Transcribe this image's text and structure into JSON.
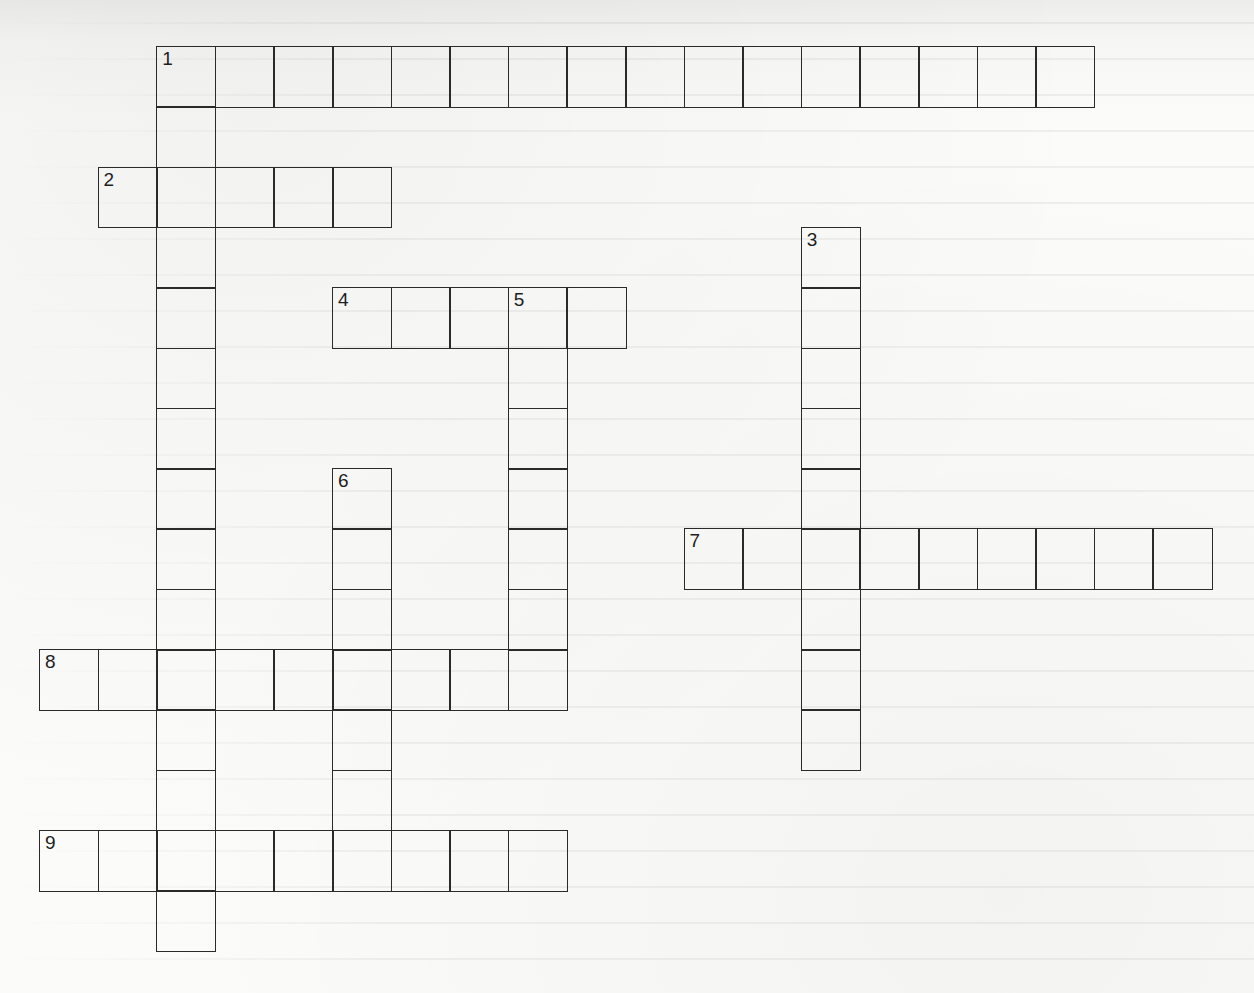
{
  "puzzle": {
    "type": "crossword",
    "grid_origin": {
      "x": 39,
      "y": 46
    },
    "cell_size": {
      "w": 58.6,
      "h": 60.3
    },
    "line_color": "#2a2a2a",
    "paper_color": "#fbfbfa",
    "entries": [
      {
        "number": "1",
        "direction": "across",
        "row": 0,
        "col": 2,
        "length": 16
      },
      {
        "number": "1",
        "direction": "down",
        "row": 0,
        "col": 2,
        "length": 15
      },
      {
        "number": "2",
        "direction": "across",
        "row": 2,
        "col": 1,
        "length": 5
      },
      {
        "number": "3",
        "direction": "down",
        "row": 3,
        "col": 13,
        "length": 9
      },
      {
        "number": "4",
        "direction": "across",
        "row": 4,
        "col": 5,
        "length": 5
      },
      {
        "number": "5",
        "direction": "down",
        "row": 4,
        "col": 8,
        "length": 7
      },
      {
        "number": "6",
        "direction": "down",
        "row": 7,
        "col": 5,
        "length": 7
      },
      {
        "number": "7",
        "direction": "across",
        "row": 8,
        "col": 11,
        "length": 9
      },
      {
        "number": "8",
        "direction": "across",
        "row": 10,
        "col": 0,
        "length": 9
      },
      {
        "number": "9",
        "direction": "across",
        "row": 13,
        "col": 0,
        "length": 9
      }
    ]
  }
}
